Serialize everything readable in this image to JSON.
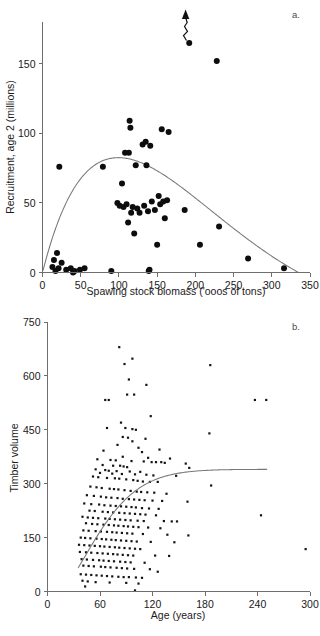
{
  "figure": {
    "panel_a_label": "a.",
    "panel_b_label": "b."
  },
  "chart_data": [
    {
      "type": "scatter",
      "panel": "a.",
      "title": "",
      "xlabel": "Spawing stock biomass ('ooos of tons)",
      "ylabel": "Recruitment, age 2 (millions)",
      "xlim": [
        0,
        350
      ],
      "ylim": [
        0,
        180
      ],
      "xticks": [
        0,
        50,
        100,
        150,
        200,
        250,
        300,
        350
      ],
      "yticks": [
        0,
        50,
        100,
        150
      ],
      "grid": false,
      "legend": "none",
      "marker": "filled-circle",
      "annotations": [
        {
          "kind": "zigzag-arrow",
          "note": "upward wavy arrow above highest point",
          "x": 192,
          "y": 165
        }
      ],
      "points": [
        {
          "x": 13,
          "y": 4
        },
        {
          "x": 15,
          "y": 9
        },
        {
          "x": 17,
          "y": 1
        },
        {
          "x": 19,
          "y": 14
        },
        {
          "x": 21,
          "y": 3
        },
        {
          "x": 22,
          "y": 76
        },
        {
          "x": 25,
          "y": 7
        },
        {
          "x": 31,
          "y": 2
        },
        {
          "x": 37,
          "y": 3
        },
        {
          "x": 40,
          "y": 0
        },
        {
          "x": 42,
          "y": 1
        },
        {
          "x": 49,
          "y": 2
        },
        {
          "x": 55,
          "y": 3
        },
        {
          "x": 79,
          "y": 76
        },
        {
          "x": 90,
          "y": 1
        },
        {
          "x": 98,
          "y": 50
        },
        {
          "x": 101,
          "y": 48
        },
        {
          "x": 104,
          "y": 64
        },
        {
          "x": 106,
          "y": 47
        },
        {
          "x": 108,
          "y": 86
        },
        {
          "x": 110,
          "y": 49
        },
        {
          "x": 112,
          "y": 36
        },
        {
          "x": 113,
          "y": 86
        },
        {
          "x": 114,
          "y": 109
        },
        {
          "x": 115,
          "y": 104
        },
        {
          "x": 116,
          "y": 43
        },
        {
          "x": 118,
          "y": 47
        },
        {
          "x": 120,
          "y": 28
        },
        {
          "x": 122,
          "y": 77
        },
        {
          "x": 124,
          "y": 46
        },
        {
          "x": 127,
          "y": 43
        },
        {
          "x": 131,
          "y": 92
        },
        {
          "x": 133,
          "y": 48
        },
        {
          "x": 135,
          "y": 94
        },
        {
          "x": 136,
          "y": 77
        },
        {
          "x": 138,
          "y": 44
        },
        {
          "x": 139,
          "y": 1
        },
        {
          "x": 140,
          "y": 2
        },
        {
          "x": 141,
          "y": 91
        },
        {
          "x": 143,
          "y": 51
        },
        {
          "x": 147,
          "y": 45
        },
        {
          "x": 150,
          "y": 20
        },
        {
          "x": 152,
          "y": 55
        },
        {
          "x": 154,
          "y": 49
        },
        {
          "x": 156,
          "y": 103
        },
        {
          "x": 158,
          "y": 51
        },
        {
          "x": 160,
          "y": 39
        },
        {
          "x": 163,
          "y": 52
        },
        {
          "x": 165,
          "y": 101
        },
        {
          "x": 186,
          "y": 45
        },
        {
          "x": 192,
          "y": 165
        },
        {
          "x": 206,
          "y": 20
        },
        {
          "x": 228,
          "y": 152
        },
        {
          "x": 231,
          "y": 33
        },
        {
          "x": 269,
          "y": 10
        },
        {
          "x": 316,
          "y": 3
        }
      ],
      "fit_curve": {
        "kind": "ricker",
        "description": "dome-shaped stock-recruitment curve peaking near (105, 84) and returning to zero near x=335",
        "peak": {
          "x": 105,
          "y": 84
        },
        "x_zero_right": 335
      }
    },
    {
      "type": "scatter",
      "panel": "b.",
      "title": "",
      "xlabel": "Age (years)",
      "ylabel": "Timber volume",
      "xlim": [
        0,
        300
      ],
      "ylim": [
        0,
        750
      ],
      "xticks": [
        0,
        60,
        120,
        180,
        240,
        300
      ],
      "yticks": [
        0,
        150,
        300,
        450,
        600,
        750
      ],
      "grid": false,
      "legend": "none",
      "marker": "filled-square",
      "fit_curve": {
        "kind": "asymptotic-growth",
        "description": "monotone increasing curve rising from about (35,115) and plateauing near 340 beyond age 180",
        "asymptote": 340,
        "x_start": 35,
        "x_end": 252
      },
      "points": [
        {
          "x": 82,
          "y": 680
        },
        {
          "x": 97,
          "y": 648
        },
        {
          "x": 88,
          "y": 633
        },
        {
          "x": 186,
          "y": 630
        },
        {
          "x": 93,
          "y": 590
        },
        {
          "x": 113,
          "y": 575
        },
        {
          "x": 91,
          "y": 548
        },
        {
          "x": 99,
          "y": 548
        },
        {
          "x": 66,
          "y": 533
        },
        {
          "x": 70,
          "y": 533
        },
        {
          "x": 237,
          "y": 533
        },
        {
          "x": 250,
          "y": 533
        },
        {
          "x": 118,
          "y": 488
        },
        {
          "x": 84,
          "y": 470
        },
        {
          "x": 68,
          "y": 455
        },
        {
          "x": 89,
          "y": 455
        },
        {
          "x": 97,
          "y": 452
        },
        {
          "x": 101,
          "y": 450
        },
        {
          "x": 185,
          "y": 440
        },
        {
          "x": 86,
          "y": 430
        },
        {
          "x": 92,
          "y": 428
        },
        {
          "x": 112,
          "y": 425
        },
        {
          "x": 97,
          "y": 418
        },
        {
          "x": 80,
          "y": 408
        },
        {
          "x": 104,
          "y": 400
        },
        {
          "x": 128,
          "y": 395
        },
        {
          "x": 64,
          "y": 392
        },
        {
          "x": 108,
          "y": 388
        },
        {
          "x": 86,
          "y": 375
        },
        {
          "x": 115,
          "y": 372
        },
        {
          "x": 140,
          "y": 370
        },
        {
          "x": 57,
          "y": 368
        },
        {
          "x": 72,
          "y": 366
        },
        {
          "x": 78,
          "y": 365
        },
        {
          "x": 96,
          "y": 363
        },
        {
          "x": 110,
          "y": 362
        },
        {
          "x": 119,
          "y": 360
        },
        {
          "x": 124,
          "y": 360
        },
        {
          "x": 130,
          "y": 360
        },
        {
          "x": 134,
          "y": 358
        },
        {
          "x": 158,
          "y": 356
        },
        {
          "x": 63,
          "y": 352
        },
        {
          "x": 75,
          "y": 350
        },
        {
          "x": 83,
          "y": 350
        },
        {
          "x": 87,
          "y": 348
        },
        {
          "x": 91,
          "y": 346
        },
        {
          "x": 162,
          "y": 344
        },
        {
          "x": 55,
          "y": 340
        },
        {
          "x": 66,
          "y": 338
        },
        {
          "x": 70,
          "y": 336
        },
        {
          "x": 79,
          "y": 335
        },
        {
          "x": 94,
          "y": 334
        },
        {
          "x": 106,
          "y": 333
        },
        {
          "x": 60,
          "y": 330
        },
        {
          "x": 74,
          "y": 328
        },
        {
          "x": 85,
          "y": 327
        },
        {
          "x": 100,
          "y": 326
        },
        {
          "x": 113,
          "y": 325
        },
        {
          "x": 121,
          "y": 323
        },
        {
          "x": 147,
          "y": 322
        },
        {
          "x": 52,
          "y": 320
        },
        {
          "x": 58,
          "y": 318
        },
        {
          "x": 68,
          "y": 316
        },
        {
          "x": 77,
          "y": 315
        },
        {
          "x": 82,
          "y": 314
        },
        {
          "x": 90,
          "y": 312
        },
        {
          "x": 98,
          "y": 310
        },
        {
          "x": 103,
          "y": 308
        },
        {
          "x": 109,
          "y": 306
        },
        {
          "x": 117,
          "y": 305
        },
        {
          "x": 126,
          "y": 305
        },
        {
          "x": 187,
          "y": 295
        },
        {
          "x": 49,
          "y": 292
        },
        {
          "x": 56,
          "y": 290
        },
        {
          "x": 62,
          "y": 288
        },
        {
          "x": 71,
          "y": 286
        },
        {
          "x": 76,
          "y": 285
        },
        {
          "x": 81,
          "y": 284
        },
        {
          "x": 88,
          "y": 282
        },
        {
          "x": 95,
          "y": 280
        },
        {
          "x": 102,
          "y": 278
        },
        {
          "x": 107,
          "y": 277
        },
        {
          "x": 114,
          "y": 276
        },
        {
          "x": 122,
          "y": 275
        },
        {
          "x": 136,
          "y": 272
        },
        {
          "x": 45,
          "y": 268
        },
        {
          "x": 53,
          "y": 266
        },
        {
          "x": 61,
          "y": 264
        },
        {
          "x": 67,
          "y": 262
        },
        {
          "x": 73,
          "y": 261
        },
        {
          "x": 80,
          "y": 260
        },
        {
          "x": 86,
          "y": 258
        },
        {
          "x": 93,
          "y": 257
        },
        {
          "x": 99,
          "y": 256
        },
        {
          "x": 105,
          "y": 255
        },
        {
          "x": 111,
          "y": 254
        },
        {
          "x": 120,
          "y": 253
        },
        {
          "x": 131,
          "y": 252
        },
        {
          "x": 160,
          "y": 250
        },
        {
          "x": 42,
          "y": 245
        },
        {
          "x": 50,
          "y": 243
        },
        {
          "x": 59,
          "y": 242
        },
        {
          "x": 65,
          "y": 240
        },
        {
          "x": 72,
          "y": 239
        },
        {
          "x": 78,
          "y": 238
        },
        {
          "x": 84,
          "y": 237
        },
        {
          "x": 90,
          "y": 236
        },
        {
          "x": 96,
          "y": 235
        },
        {
          "x": 101,
          "y": 234
        },
        {
          "x": 108,
          "y": 232
        },
        {
          "x": 116,
          "y": 231
        },
        {
          "x": 127,
          "y": 230
        },
        {
          "x": 48,
          "y": 225
        },
        {
          "x": 54,
          "y": 224
        },
        {
          "x": 63,
          "y": 222
        },
        {
          "x": 69,
          "y": 221
        },
        {
          "x": 75,
          "y": 220
        },
        {
          "x": 82,
          "y": 219
        },
        {
          "x": 88,
          "y": 218
        },
        {
          "x": 94,
          "y": 217
        },
        {
          "x": 100,
          "y": 216
        },
        {
          "x": 106,
          "y": 215
        },
        {
          "x": 112,
          "y": 214
        },
        {
          "x": 124,
          "y": 212
        },
        {
          "x": 244,
          "y": 212
        },
        {
          "x": 40,
          "y": 208
        },
        {
          "x": 46,
          "y": 206
        },
        {
          "x": 52,
          "y": 205
        },
        {
          "x": 58,
          "y": 204
        },
        {
          "x": 66,
          "y": 203
        },
        {
          "x": 71,
          "y": 202
        },
        {
          "x": 77,
          "y": 201
        },
        {
          "x": 83,
          "y": 200
        },
        {
          "x": 89,
          "y": 199
        },
        {
          "x": 95,
          "y": 198
        },
        {
          "x": 103,
          "y": 197
        },
        {
          "x": 110,
          "y": 196
        },
        {
          "x": 133,
          "y": 196
        },
        {
          "x": 142,
          "y": 195
        },
        {
          "x": 148,
          "y": 195
        },
        {
          "x": 44,
          "y": 190
        },
        {
          "x": 51,
          "y": 188
        },
        {
          "x": 57,
          "y": 187
        },
        {
          "x": 64,
          "y": 186
        },
        {
          "x": 70,
          "y": 185
        },
        {
          "x": 76,
          "y": 184
        },
        {
          "x": 81,
          "y": 183
        },
        {
          "x": 87,
          "y": 182
        },
        {
          "x": 92,
          "y": 181
        },
        {
          "x": 98,
          "y": 180
        },
        {
          "x": 104,
          "y": 179
        },
        {
          "x": 115,
          "y": 178
        },
        {
          "x": 129,
          "y": 176
        },
        {
          "x": 41,
          "y": 170
        },
        {
          "x": 47,
          "y": 169
        },
        {
          "x": 55,
          "y": 168
        },
        {
          "x": 61,
          "y": 167
        },
        {
          "x": 68,
          "y": 166
        },
        {
          "x": 74,
          "y": 165
        },
        {
          "x": 79,
          "y": 164
        },
        {
          "x": 85,
          "y": 163
        },
        {
          "x": 91,
          "y": 162
        },
        {
          "x": 97,
          "y": 161
        },
        {
          "x": 109,
          "y": 160
        },
        {
          "x": 137,
          "y": 158
        },
        {
          "x": 161,
          "y": 156
        },
        {
          "x": 38,
          "y": 150
        },
        {
          "x": 43,
          "y": 149
        },
        {
          "x": 49,
          "y": 148
        },
        {
          "x": 56,
          "y": 147
        },
        {
          "x": 62,
          "y": 146
        },
        {
          "x": 67,
          "y": 145
        },
        {
          "x": 73,
          "y": 144
        },
        {
          "x": 78,
          "y": 143
        },
        {
          "x": 84,
          "y": 142
        },
        {
          "x": 90,
          "y": 141
        },
        {
          "x": 96,
          "y": 140
        },
        {
          "x": 102,
          "y": 139
        },
        {
          "x": 118,
          "y": 138
        },
        {
          "x": 145,
          "y": 137
        },
        {
          "x": 36,
          "y": 130
        },
        {
          "x": 42,
          "y": 129
        },
        {
          "x": 48,
          "y": 128
        },
        {
          "x": 54,
          "y": 127
        },
        {
          "x": 60,
          "y": 126
        },
        {
          "x": 65,
          "y": 125
        },
        {
          "x": 71,
          "y": 124
        },
        {
          "x": 77,
          "y": 123
        },
        {
          "x": 82,
          "y": 122
        },
        {
          "x": 88,
          "y": 121
        },
        {
          "x": 94,
          "y": 120
        },
        {
          "x": 100,
          "y": 119
        },
        {
          "x": 106,
          "y": 118
        },
        {
          "x": 295,
          "y": 118
        },
        {
          "x": 37,
          "y": 110
        },
        {
          "x": 44,
          "y": 109
        },
        {
          "x": 50,
          "y": 108
        },
        {
          "x": 57,
          "y": 107
        },
        {
          "x": 63,
          "y": 106
        },
        {
          "x": 69,
          "y": 105
        },
        {
          "x": 75,
          "y": 104
        },
        {
          "x": 80,
          "y": 103
        },
        {
          "x": 86,
          "y": 102
        },
        {
          "x": 92,
          "y": 101
        },
        {
          "x": 98,
          "y": 100
        },
        {
          "x": 123,
          "y": 100
        },
        {
          "x": 139,
          "y": 99
        },
        {
          "x": 39,
          "y": 90
        },
        {
          "x": 45,
          "y": 89
        },
        {
          "x": 52,
          "y": 88
        },
        {
          "x": 59,
          "y": 87
        },
        {
          "x": 64,
          "y": 86
        },
        {
          "x": 70,
          "y": 85
        },
        {
          "x": 76,
          "y": 84
        },
        {
          "x": 83,
          "y": 83
        },
        {
          "x": 89,
          "y": 82
        },
        {
          "x": 95,
          "y": 81
        },
        {
          "x": 111,
          "y": 80
        },
        {
          "x": 41,
          "y": 72
        },
        {
          "x": 47,
          "y": 71
        },
        {
          "x": 53,
          "y": 70
        },
        {
          "x": 61,
          "y": 69
        },
        {
          "x": 66,
          "y": 68
        },
        {
          "x": 72,
          "y": 67
        },
        {
          "x": 79,
          "y": 66
        },
        {
          "x": 85,
          "y": 65
        },
        {
          "x": 91,
          "y": 64
        },
        {
          "x": 99,
          "y": 63
        },
        {
          "x": 117,
          "y": 62
        },
        {
          "x": 126,
          "y": 55
        },
        {
          "x": 38,
          "y": 48
        },
        {
          "x": 44,
          "y": 47
        },
        {
          "x": 50,
          "y": 46
        },
        {
          "x": 56,
          "y": 45
        },
        {
          "x": 62,
          "y": 44
        },
        {
          "x": 68,
          "y": 43
        },
        {
          "x": 74,
          "y": 42
        },
        {
          "x": 81,
          "y": 41
        },
        {
          "x": 87,
          "y": 40
        },
        {
          "x": 93,
          "y": 40
        },
        {
          "x": 101,
          "y": 39
        },
        {
          "x": 108,
          "y": 38
        },
        {
          "x": 40,
          "y": 30
        },
        {
          "x": 46,
          "y": 28
        },
        {
          "x": 55,
          "y": 26
        },
        {
          "x": 71,
          "y": 25
        },
        {
          "x": 90,
          "y": 24
        },
        {
          "x": 104,
          "y": 22
        },
        {
          "x": 43,
          "y": 14
        },
        {
          "x": 100,
          "y": 3
        }
      ]
    }
  ]
}
